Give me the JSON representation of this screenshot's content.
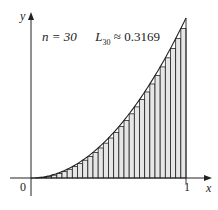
{
  "chart_data": {
    "type": "bar",
    "title": "",
    "annotation": "n = 30   L30 ≈ 0.3169",
    "function": "y = x^2",
    "method": "left Riemann sum",
    "n": 30,
    "estimate": 0.3169,
    "xlabel": "x",
    "ylabel": "y",
    "x_ticks": [
      "0",
      "1"
    ],
    "xlim": [
      0,
      1
    ],
    "ylim": [
      0,
      1
    ],
    "grid": false,
    "legend": null,
    "rect_fill": "#e6e6e6",
    "line_color": "#222222"
  },
  "labels": {
    "n_text": "n = 30",
    "L_symbol": "L",
    "L_sub": "30",
    "L_value": "≈ 0.3169",
    "x_axis": "x",
    "y_axis": "y",
    "origin": "0",
    "one": "1"
  }
}
